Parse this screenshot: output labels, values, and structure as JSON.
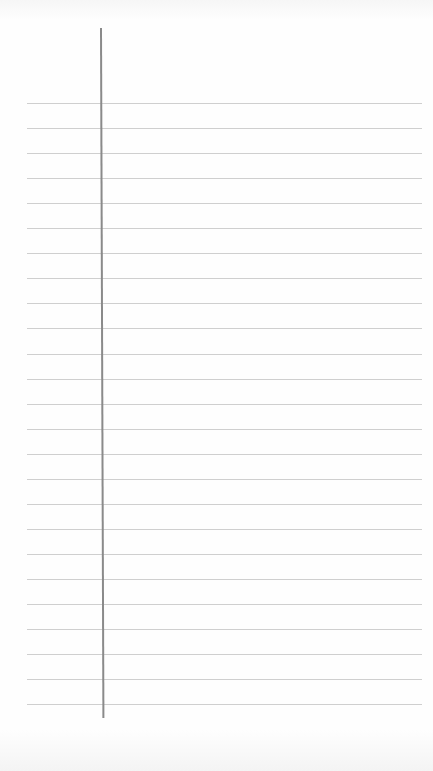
{
  "paper": {
    "type": "lined notebook page",
    "ruled_line_count": 25,
    "first_line_y": 103,
    "line_spacing": 25.05,
    "line_color": "#cfcfcf",
    "margin_line_color": "#8a8a8a",
    "background": "#fdfdfd"
  }
}
